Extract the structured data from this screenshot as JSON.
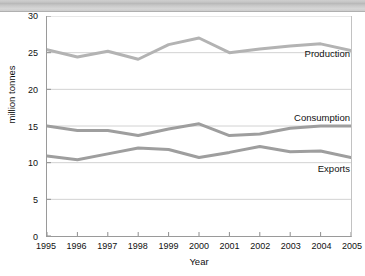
{
  "header": {
    "title": ""
  },
  "chart_data": {
    "type": "line",
    "title": "",
    "xlabel": "Year",
    "ylabel": "million tonnes",
    "grid": true,
    "legend_position": "inline-right",
    "categories": [
      1995,
      1996,
      1997,
      1998,
      1999,
      2000,
      2001,
      2002,
      2003,
      2004,
      2005
    ],
    "xtick_labels": [
      "1995",
      "1996",
      "1997",
      "1998",
      "1999",
      "2000",
      "2001",
      "2002",
      "2003",
      "2004",
      "2005"
    ],
    "ytick_labels": [
      "0",
      "5",
      "10",
      "15",
      "20",
      "25",
      "30"
    ],
    "ytick_values": [
      0,
      5,
      10,
      15,
      20,
      25,
      30
    ],
    "xlim": [
      1995,
      2005
    ],
    "ylim": [
      0,
      30
    ],
    "series": [
      {
        "name": "Production",
        "color": "#b3b3b3",
        "label_y": 25.0,
        "values": [
          25.4,
          24.4,
          25.2,
          24.1,
          26.1,
          27.0,
          25.0,
          25.5,
          25.9,
          26.2,
          25.3
        ]
      },
      {
        "name": "Consumption",
        "color": "#9e9e9e",
        "label_y": 16.3,
        "values": [
          15.0,
          14.4,
          14.4,
          13.7,
          14.6,
          15.3,
          13.7,
          13.9,
          14.7,
          15.0,
          15.0
        ]
      },
      {
        "name": "Exports",
        "color": "#9e9e9e",
        "label_y": 9.3,
        "values": [
          10.9,
          10.4,
          11.2,
          12.0,
          11.8,
          10.7,
          11.4,
          12.2,
          11.5,
          11.6,
          10.7
        ]
      }
    ]
  }
}
